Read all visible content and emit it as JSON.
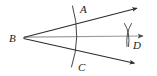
{
  "figure": {
    "background_color": "#ffffff",
    "ray_color": "#2b2b2b",
    "bisector_color": "#9a9a9a",
    "arc_color": "#3a3a3a",
    "label_color": "#1a1a1a",
    "canvas": {
      "width": 157,
      "height": 76
    }
  },
  "labels": {
    "vertex": "B",
    "upper_point": "A",
    "lower_point": "C",
    "bisector_point": "D"
  },
  "geometry": {
    "vertex": {
      "x": 23,
      "y": 38
    },
    "upper_ray_end": {
      "x": 141,
      "y": 7
    },
    "lower_ray_end": {
      "x": 139,
      "y": 65
    },
    "bisector_ray_end": {
      "x": 148,
      "y": 36
    },
    "arc_upper_intersection": {
      "x": 77,
      "y": 15
    },
    "arc_lower_intersection": {
      "x": 76,
      "y": 57
    },
    "cross_arcs_center": {
      "x": 128,
      "y": 35
    }
  },
  "label_positions": {
    "vertex": {
      "x": 9,
      "y": 42
    },
    "upper_point": {
      "x": 80,
      "y": 13
    },
    "lower_point": {
      "x": 78,
      "y": 70
    },
    "bisector_point": {
      "x": 133,
      "y": 48
    }
  }
}
